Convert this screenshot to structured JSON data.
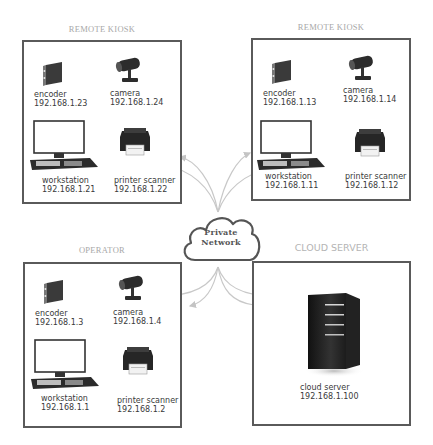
{
  "zones": [
    {
      "id": "remote-kiosk-1",
      "title": "REMOTE KIOSK",
      "devices": [
        {
          "type": "encoder",
          "name": "encoder",
          "ip": "192.168.1.23"
        },
        {
          "type": "camera",
          "name": "camera",
          "ip": "192.168.1.24"
        },
        {
          "type": "workstation",
          "name": "workstation",
          "ip": "192.168.1.21"
        },
        {
          "type": "printer",
          "name": "printer scanner",
          "ip": "192.168.1.22"
        }
      ]
    },
    {
      "id": "remote-kiosk-2",
      "title": "REMOTE KIOSK",
      "devices": [
        {
          "type": "encoder",
          "name": "encoder",
          "ip": "192.168.1.13"
        },
        {
          "type": "camera",
          "name": "camera",
          "ip": "192.168.1.14"
        },
        {
          "type": "workstation",
          "name": "workstation",
          "ip": "192.168.1.11"
        },
        {
          "type": "printer",
          "name": "printer scanner",
          "ip": "192.168.1.12"
        }
      ]
    },
    {
      "id": "operator",
      "title": "OPERATOR",
      "devices": [
        {
          "type": "encoder",
          "name": "encoder",
          "ip": "192.168.1.3"
        },
        {
          "type": "camera",
          "name": "camera",
          "ip": "192.168.1.4"
        },
        {
          "type": "workstation",
          "name": "workstation",
          "ip": "192.168.1.1"
        },
        {
          "type": "printer",
          "name": "printer scanner",
          "ip": "192.168.1.2"
        }
      ]
    },
    {
      "id": "cloud-server",
      "title": "CLOUD SERVER",
      "devices": [
        {
          "type": "server",
          "name": "cloud server",
          "ip": "192.168.1.100"
        }
      ]
    }
  ],
  "hub": {
    "type": "cloud",
    "line1": "Private",
    "line2": "Network"
  },
  "colors": {
    "box_border": "#5a5a5a",
    "title_text": "#a8a8a8",
    "link_lines": "#c4c4c4",
    "cloud_border": "#555555"
  }
}
